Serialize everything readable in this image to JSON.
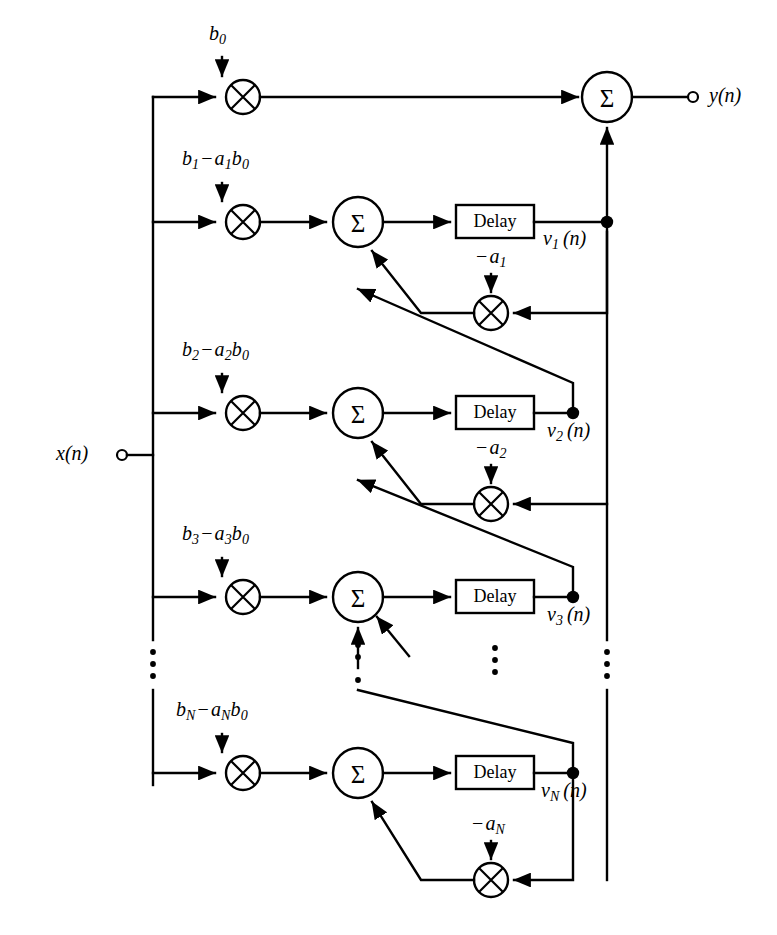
{
  "diagram": {
    "input_label": "x(n)",
    "output_label": "y(n)",
    "delay_label": "Delay",
    "sum_symbol": "Σ",
    "multiply_symbol": "×",
    "ellipsis_symbol": "⋮",
    "colors": {
      "line": "#000000",
      "background": "#ffffff",
      "text": "#000000"
    },
    "top_coefficient": {
      "base": "b",
      "sub": "0",
      "text": "b0"
    },
    "stages": [
      {
        "index": "1",
        "feedforward_coefficient": "b1 − a1 b0",
        "feedback_coefficient": "−a1",
        "state_label": "v1(n)",
        "delay_label": "Delay"
      },
      {
        "index": "2",
        "feedforward_coefficient": "b2 − a2 b0",
        "feedback_coefficient": "−a2",
        "state_label": "v2(n)",
        "delay_label": "Delay"
      },
      {
        "index": "3",
        "feedforward_coefficient": "b3 − a3 b0",
        "feedback_coefficient": "",
        "state_label": "v3(n)",
        "delay_label": "Delay"
      },
      {
        "index": "N",
        "feedforward_coefficient": "bN − aN b0",
        "feedback_coefficient": "−aN",
        "state_label": "vN(n)",
        "delay_label": "Delay"
      }
    ],
    "node_counts": {
      "multipliers": 7,
      "summers": 5,
      "delays": 4,
      "junction_dots": 4
    }
  }
}
